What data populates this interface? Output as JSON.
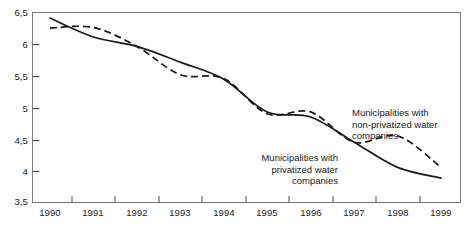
{
  "chart_data": {
    "type": "line",
    "title": "",
    "subtitle": "",
    "xlabel": "",
    "ylabel": "",
    "xlim": [
      1990,
      1999
    ],
    "ylim": [
      3.5,
      6.5
    ],
    "grid": false,
    "legend_position": "inline-annotations",
    "decimal_separator": ",",
    "x": [
      1990,
      1991,
      1992,
      1993,
      1994,
      1995,
      1996,
      1997,
      1998,
      1999
    ],
    "y_ticks": [
      {
        "value": 6.5,
        "label": "6,5"
      },
      {
        "value": 6.0,
        "label": "6"
      },
      {
        "value": 5.5,
        "label": "5,5"
      },
      {
        "value": 5.0,
        "label": "5"
      },
      {
        "value": 4.5,
        "label": "4,5"
      },
      {
        "value": 4.0,
        "label": "4"
      },
      {
        "value": 3.5,
        "label": "3,5"
      }
    ],
    "x_ticks": [
      {
        "value": 1990,
        "label": "1990"
      },
      {
        "value": 1991,
        "label": "1991"
      },
      {
        "value": 1992,
        "label": "1992"
      },
      {
        "value": 1993,
        "label": "1993"
      },
      {
        "value": 1994,
        "label": "1994"
      },
      {
        "value": 1995,
        "label": "1995"
      },
      {
        "value": 1996,
        "label": "1996"
      },
      {
        "value": 1997,
        "label": "1997"
      },
      {
        "value": 1998,
        "label": "1998"
      },
      {
        "value": 1999,
        "label": "1999"
      }
    ],
    "series": [
      {
        "name": "Municipalities with privatized water companies",
        "style": "solid",
        "color": "#1a1a1a",
        "annotation": "Municipalities with\nprivatized water\ncompanies",
        "values": [
          6.42,
          6.12,
          5.97,
          5.72,
          5.45,
          4.93,
          4.85,
          4.45,
          4.05,
          3.88
        ]
      },
      {
        "name": "Municipalities with non-privatized water companies",
        "style": "dashed",
        "color": "#1a1a1a",
        "annotation": "Municipalities with\nnon-privatized water\ncompanies",
        "values": [
          6.26,
          6.27,
          5.97,
          5.52,
          5.46,
          4.9,
          4.93,
          4.45,
          4.55,
          4.05
        ]
      }
    ]
  },
  "axes": {
    "frame_color": "#7a7a7a",
    "tick_color": "#4a4a4a"
  }
}
